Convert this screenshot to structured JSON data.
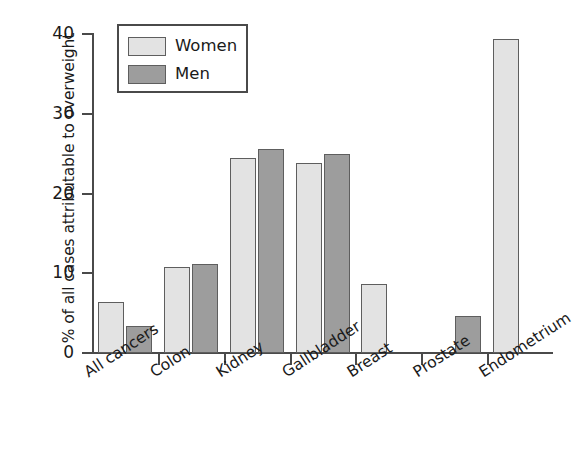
{
  "chart_data": {
    "type": "bar",
    "title": "",
    "subtitle": "",
    "xlabel": "",
    "ylabel": "% of all cases attributable to overweight",
    "categories": [
      "All cancers",
      "Colon",
      "Kidney",
      "Gallbladder",
      "Breast",
      "Prostate",
      "Endometrium"
    ],
    "series": [
      {
        "name": "Women",
        "color": "#e3e3e3",
        "values": [
          6.4,
          10.8,
          24.5,
          23.8,
          8.7,
          null,
          39.4
        ]
      },
      {
        "name": "Men",
        "color": "#9d9d9d",
        "values": [
          3.4,
          11.2,
          25.6,
          24.9,
          null,
          4.6,
          null
        ]
      }
    ],
    "ylim": [
      0,
      40
    ],
    "yticks": [
      0,
      10,
      20,
      30,
      40
    ],
    "ytick_labels": [
      "0",
      "10",
      "20",
      "30",
      "40"
    ],
    "grid": false,
    "legend_position": "upper-left",
    "bar_edge_color": "#5e5e5e",
    "axis_color": "#4a4a4a",
    "background": "#ffffff"
  },
  "legend": {
    "entries": [
      {
        "label": "Women",
        "swatch": "women"
      },
      {
        "label": "Men",
        "swatch": "men"
      }
    ]
  },
  "axes": {
    "y_title": "% of all cases attributable to overweight",
    "y_ticks": [
      {
        "value": 40,
        "label": "40"
      },
      {
        "value": 30,
        "label": "30"
      },
      {
        "value": 20,
        "label": "20"
      },
      {
        "value": 10,
        "label": "10"
      },
      {
        "value": 0,
        "label": "0"
      }
    ],
    "x_categories": [
      {
        "label": "All cancers"
      },
      {
        "label": "Colon"
      },
      {
        "label": "Kidney"
      },
      {
        "label": "Gallbladder"
      },
      {
        "label": "Breast"
      },
      {
        "label": "Prostate"
      },
      {
        "label": "Endometrium"
      }
    ]
  }
}
